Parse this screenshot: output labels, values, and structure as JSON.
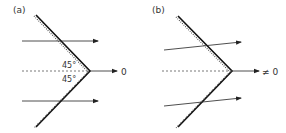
{
  "panels": [
    {
      "id": "a",
      "label": "(a)",
      "angle_top": "45°",
      "angle_bottom": "45°",
      "output": "0"
    },
    {
      "id": "b",
      "label": "(b)",
      "output": "≠ 0"
    }
  ],
  "colors": {
    "line": "#111111",
    "arrow": "#222222",
    "dashed": "#555555"
  }
}
